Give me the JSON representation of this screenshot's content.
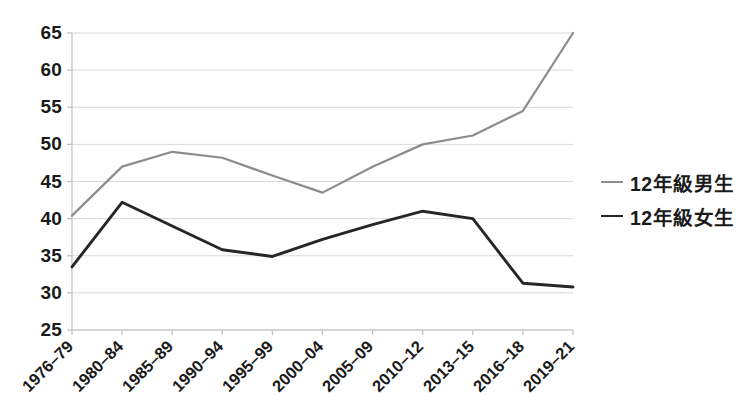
{
  "chart_data": {
    "type": "line",
    "title": "",
    "subtitle": "",
    "xlabel": "",
    "ylabel": "",
    "categories": [
      "1976–79",
      "1980–84",
      "1985–89",
      "1990–94",
      "1995–99",
      "2000–04",
      "2005–09",
      "2010–12",
      "2013–15",
      "2016–18",
      "2019–21"
    ],
    "ylim": [
      25,
      65
    ],
    "yticks": [
      25,
      30,
      35,
      40,
      45,
      50,
      55,
      60,
      65
    ],
    "ytick_labels": [
      "25",
      "30",
      "35",
      "40",
      "45",
      "50",
      "55",
      "60",
      "65"
    ],
    "grid": true,
    "grid_axis": "y",
    "legend_position": "right",
    "series": [
      {
        "name": "12年級男生",
        "color": "#8c8c8c",
        "values": [
          40.4,
          47.0,
          49.0,
          48.2,
          45.8,
          43.5,
          47.0,
          50.0,
          51.2,
          54.5,
          65.0
        ]
      },
      {
        "name": "12年級女生",
        "color": "#262626",
        "values": [
          33.5,
          42.2,
          39.0,
          35.8,
          34.9,
          37.2,
          39.2,
          41.0,
          40.0,
          31.3,
          30.8
        ]
      }
    ]
  },
  "legend": {
    "items": [
      {
        "label": "12年級男生",
        "color": "#8c8c8c"
      },
      {
        "label": "12年級女生",
        "color": "#262626"
      }
    ]
  },
  "style": {
    "grid_color": "#d9d9d9",
    "axis_color": "#bfbfbf",
    "text_color": "#1a1a1a",
    "background": "#ffffff"
  },
  "plot_geometry": {
    "left": 72,
    "right": 573,
    "top": 33,
    "bottom": 330
  }
}
